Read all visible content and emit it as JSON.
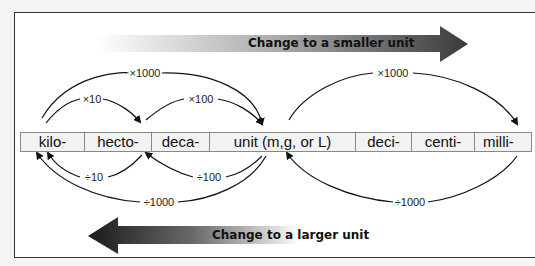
{
  "diagram": {
    "top_banner": {
      "label": "Change to a smaller unit",
      "direction": "right"
    },
    "bottom_banner": {
      "label": "Change to a larger unit",
      "direction": "left"
    },
    "units": [
      {
        "label": "kilo-"
      },
      {
        "label": "hecto-"
      },
      {
        "label": "deca-"
      },
      {
        "label": "unit (m,g, or L)"
      },
      {
        "label": "deci-"
      },
      {
        "label": "centi-"
      },
      {
        "label": "milli-"
      }
    ],
    "multiply_arrows": [
      {
        "label": "×1000",
        "from": "kilo-",
        "to": "unit (m,g, or L)"
      },
      {
        "label": "×10",
        "from": "kilo-",
        "to": "hecto-"
      },
      {
        "label": "×100",
        "from": "deca-",
        "to": "unit (m,g, or L)"
      },
      {
        "label": "×1000",
        "from": "unit (m,g, or L)",
        "to": "milli-"
      }
    ],
    "divide_arrows": [
      {
        "label": "÷10",
        "from": "hecto-",
        "to": "kilo-"
      },
      {
        "label": "÷100",
        "from": "unit (m,g, or L)",
        "to": "deca-"
      },
      {
        "label": "÷1000",
        "from": "unit (m,g, or L)",
        "to": "kilo-"
      },
      {
        "label": "÷1000",
        "from": "milli-",
        "to": "unit (m,g, or L)"
      }
    ]
  }
}
